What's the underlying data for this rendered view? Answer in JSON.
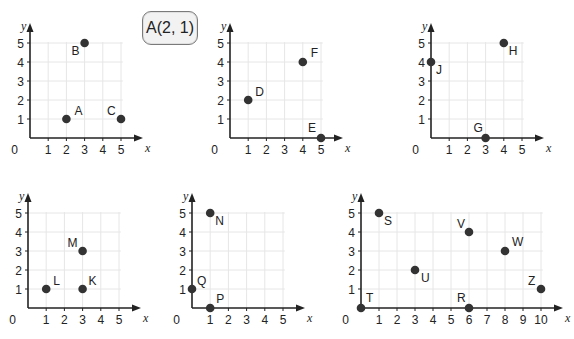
{
  "example_label": "A(2, 1)",
  "colors": {
    "axis": "#222222",
    "grid": "#e6e6e6",
    "point": "#333333",
    "text": "#222222"
  },
  "chart_data": [
    {
      "type": "scatter",
      "id": "grid1",
      "origin": [
        30,
        138
      ],
      "unit_x": 18.2,
      "unit_y": 19,
      "xmax": 5,
      "ymax": 5,
      "x_ticks": [
        1,
        2,
        3,
        4,
        5
      ],
      "y_ticks": [
        1,
        2,
        3,
        4,
        5
      ],
      "xlabel": "x",
      "ylabel": "y",
      "origin_label": "0",
      "points": [
        {
          "name": "A",
          "x": 2,
          "y": 1,
          "lx": 8,
          "ly": -4
        },
        {
          "name": "B",
          "x": 3,
          "y": 5,
          "lx": -13,
          "ly": 12
        },
        {
          "name": "C",
          "x": 5,
          "y": 1,
          "lx": -14,
          "ly": -4
        }
      ]
    },
    {
      "type": "scatter",
      "id": "grid2",
      "origin": [
        230,
        138
      ],
      "unit_x": 18.2,
      "unit_y": 19,
      "xmax": 5,
      "ymax": 5,
      "x_ticks": [
        1,
        2,
        3,
        4,
        5
      ],
      "y_ticks": [
        1,
        2,
        3,
        4,
        5
      ],
      "xlabel": "x",
      "ylabel": "y",
      "origin_label": "0",
      "points": [
        {
          "name": "D",
          "x": 1,
          "y": 2,
          "lx": 7,
          "ly": -4
        },
        {
          "name": "F",
          "x": 4,
          "y": 4,
          "lx": 8,
          "ly": -5
        },
        {
          "name": "E",
          "x": 5,
          "y": 0,
          "lx": -13,
          "ly": -6
        }
      ]
    },
    {
      "type": "scatter",
      "id": "grid3",
      "origin": [
        431,
        138
      ],
      "unit_x": 18.2,
      "unit_y": 19,
      "xmax": 5,
      "ymax": 5,
      "x_ticks": [
        1,
        2,
        3,
        4,
        5
      ],
      "y_ticks": [
        1,
        2,
        3,
        4,
        5
      ],
      "xlabel": "x",
      "ylabel": "y",
      "origin_label": "0",
      "points": [
        {
          "name": "J",
          "x": 0,
          "y": 4,
          "lx": 5,
          "ly": 12
        },
        {
          "name": "H",
          "x": 4,
          "y": 5,
          "lx": 5,
          "ly": 12
        },
        {
          "name": "G",
          "x": 3,
          "y": 0,
          "lx": -12,
          "ly": -6
        }
      ]
    },
    {
      "type": "scatter",
      "id": "grid4",
      "origin": [
        28,
        308
      ],
      "unit_x": 18.2,
      "unit_y": 19,
      "xmax": 5,
      "ymax": 5,
      "x_ticks": [
        1,
        2,
        3,
        4,
        5
      ],
      "y_ticks": [
        1,
        2,
        3,
        4,
        5
      ],
      "xlabel": "x",
      "ylabel": "y",
      "origin_label": "0",
      "points": [
        {
          "name": "L",
          "x": 1,
          "y": 1,
          "lx": 7,
          "ly": -4
        },
        {
          "name": "M",
          "x": 3,
          "y": 3,
          "lx": -15,
          "ly": -4
        },
        {
          "name": "K",
          "x": 3,
          "y": 1,
          "lx": 6,
          "ly": -4
        }
      ]
    },
    {
      "type": "scatter",
      "id": "grid5",
      "origin": [
        192,
        308
      ],
      "unit_x": 18.2,
      "unit_y": 19,
      "xmax": 5,
      "ymax": 5,
      "x_ticks": [
        1,
        2,
        3,
        4,
        5
      ],
      "y_ticks": [
        1,
        2,
        3,
        4,
        5
      ],
      "xlabel": "x",
      "ylabel": "y",
      "origin_label": "0",
      "points": [
        {
          "name": "N",
          "x": 1,
          "y": 5,
          "lx": 5,
          "ly": 12
        },
        {
          "name": "Q",
          "x": 0,
          "y": 1,
          "lx": 5,
          "ly": -4
        },
        {
          "name": "P",
          "x": 1,
          "y": 0,
          "lx": 6,
          "ly": -5
        }
      ]
    },
    {
      "type": "scatter",
      "id": "grid6",
      "origin": [
        361,
        308
      ],
      "unit_x": 18,
      "unit_y": 19,
      "xmax": 10,
      "ymax": 5,
      "x_ticks": [
        1,
        2,
        3,
        4,
        5,
        6,
        7,
        8,
        9,
        10
      ],
      "y_ticks": [
        1,
        2,
        3,
        4,
        5
      ],
      "xlabel": "x",
      "ylabel": "y",
      "origin_label": "0",
      "points": [
        {
          "name": "S",
          "x": 1,
          "y": 5,
          "lx": 5,
          "ly": 12
        },
        {
          "name": "V",
          "x": 6,
          "y": 4,
          "lx": -12,
          "ly": -4
        },
        {
          "name": "W",
          "x": 8,
          "y": 3,
          "lx": 7,
          "ly": -5
        },
        {
          "name": "U",
          "x": 3,
          "y": 2,
          "lx": 6,
          "ly": 12
        },
        {
          "name": "Z",
          "x": 10,
          "y": 1,
          "lx": -13,
          "ly": -4
        },
        {
          "name": "T",
          "x": 0,
          "y": 0,
          "lx": 5,
          "ly": -6
        },
        {
          "name": "R",
          "x": 6,
          "y": 0,
          "lx": -12,
          "ly": -6
        }
      ]
    }
  ]
}
